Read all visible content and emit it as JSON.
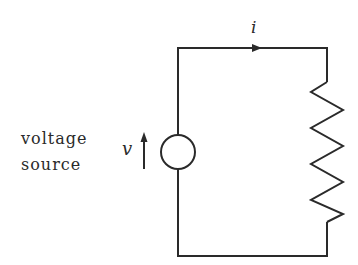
{
  "diagram": {
    "type": "circuit",
    "labels": {
      "source_line1": "voltage",
      "source_line2": "source",
      "voltage_symbol": "v",
      "current_symbol": "i"
    },
    "components": [
      {
        "kind": "voltage-source",
        "label": "voltage source"
      },
      {
        "kind": "resistor"
      }
    ],
    "colors": {
      "wire": "#2a2a2a",
      "background": "#ffffff"
    }
  }
}
